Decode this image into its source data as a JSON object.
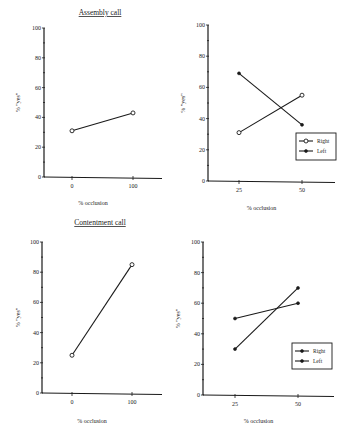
{
  "figure": {
    "titles": {
      "assembly": "Assembly call",
      "contentment": "Contentment call"
    }
  },
  "chart_data": [
    {
      "id": "assembly-midline",
      "type": "line",
      "title": "Assembly call",
      "xlabel": "% occlusion",
      "ylabel": "% \"yes\"",
      "x": [
        "0",
        "100"
      ],
      "yticks": [
        "0",
        "20",
        "40",
        "60",
        "80",
        "100"
      ],
      "ylim": [
        0,
        100
      ],
      "grid": false,
      "series": [
        {
          "name": "",
          "marker": "open",
          "values": [
            31,
            43
          ]
        }
      ],
      "layout": {
        "ox": 44,
        "y0": 177,
        "y100": 28,
        "xend": 162,
        "xpos": [
          72,
          133
        ],
        "titleX": 100,
        "titleY": 15,
        "xlabelY": 205,
        "ylabelX": 20
      }
    },
    {
      "id": "assembly-lateral",
      "type": "line",
      "title": "",
      "xlabel": "% occlusion",
      "ylabel": "% \"yes\"",
      "x": [
        "25",
        "50"
      ],
      "yticks": [
        "0",
        "20",
        "40",
        "60",
        "80",
        "100"
      ],
      "ylim": [
        0,
        100
      ],
      "grid": false,
      "legend": {
        "position": "lower right",
        "entries": [
          "Right",
          "Left"
        ]
      },
      "series": [
        {
          "name": "Right",
          "marker": "open",
          "values": [
            31,
            55
          ]
        },
        {
          "name": "Left",
          "marker": "filled",
          "values": [
            69,
            36
          ]
        }
      ],
      "layout": {
        "ox": 208,
        "y0": 181,
        "y100": 25,
        "xend": 335,
        "xpos": [
          239,
          302
        ],
        "xlabelY": 210,
        "ylabelX": 185,
        "legend": {
          "x": 296,
          "y": 133,
          "w": 40,
          "h": 27
        }
      }
    },
    {
      "id": "contentment-midline",
      "type": "line",
      "title": "Contentment call",
      "xlabel": "% occlusion",
      "ylabel": "% \"yes\"",
      "x": [
        "0",
        "100"
      ],
      "yticks": [
        "0",
        "20",
        "40",
        "60",
        "80",
        "100"
      ],
      "ylim": [
        0,
        100
      ],
      "grid": false,
      "series": [
        {
          "name": "",
          "marker": "open",
          "values": [
            25,
            85
          ]
        }
      ],
      "layout": {
        "ox": 42,
        "y0": 393,
        "y100": 242,
        "xend": 162,
        "xpos": [
          72,
          132
        ],
        "titleX": 100,
        "titleY": 225,
        "xlabelY": 423,
        "ylabelX": 20
      }
    },
    {
      "id": "contentment-lateral",
      "type": "line",
      "title": "",
      "xlabel": "% occlusion",
      "ylabel": "% \"yes\"",
      "x": [
        "25",
        "50"
      ],
      "yticks": [
        "0",
        "20",
        "40",
        "60",
        "80",
        "100"
      ],
      "ylim": [
        0,
        100
      ],
      "grid": false,
      "legend": {
        "position": "lower right",
        "entries": [
          "Right",
          "Left"
        ]
      },
      "series": [
        {
          "name": "Right",
          "marker": "filled",
          "values": [
            30,
            70
          ]
        },
        {
          "name": "Left",
          "marker": "filled",
          "values": [
            50,
            60
          ]
        }
      ],
      "layout": {
        "ox": 203,
        "y0": 395,
        "y100": 242,
        "xend": 334,
        "xpos": [
          235,
          298
        ],
        "xlabelY": 423,
        "ylabelX": 180,
        "legend": {
          "x": 292,
          "y": 343,
          "w": 40,
          "h": 26
        }
      }
    }
  ]
}
